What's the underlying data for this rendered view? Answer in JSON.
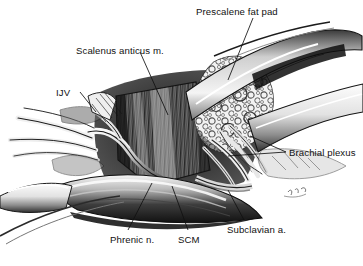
{
  "figure": {
    "kind": "surgical-anatomical-illustration",
    "background_color": "#ffffff",
    "ink_color": "#111111",
    "style": "pen-and-ink stipple / hatched medical drawing, grayscale"
  },
  "labels": [
    {
      "id": "prescalene-fat-pad",
      "text": "Prescalene fat pad",
      "x": 196,
      "y": 7,
      "anchor": "start"
    },
    {
      "id": "scalenus-anticus",
      "text": "Scalenus anticus m.",
      "x": 76,
      "y": 46,
      "anchor": "start"
    },
    {
      "id": "ijv",
      "text": "IJV",
      "x": 56,
      "y": 88,
      "anchor": "start"
    },
    {
      "id": "brachial-plexus",
      "text": "Brachial plexus",
      "x": 289,
      "y": 148,
      "anchor": "start"
    },
    {
      "id": "subclavian-artery",
      "text": "Subclavian a.",
      "x": 227,
      "y": 225,
      "anchor": "start"
    },
    {
      "id": "phrenic-nerve",
      "text": "Phrenic n.",
      "x": 110,
      "y": 235,
      "anchor": "start"
    },
    {
      "id": "scm",
      "text": "SCM",
      "x": 178,
      "y": 235,
      "anchor": "start"
    }
  ],
  "leader_lines": [
    {
      "id": "leader-prescalene-fat-pad",
      "from": [
        253,
        18
      ],
      "to": [
        228,
        80
      ]
    },
    {
      "id": "leader-scalenus-anticus",
      "from": [
        140,
        52
      ],
      "to": [
        168,
        115
      ]
    },
    {
      "id": "leader-ijv",
      "from": [
        80,
        92
      ],
      "to": [
        96,
        112
      ]
    },
    {
      "id": "leader-brachial-plexus-a",
      "from": [
        286,
        152
      ],
      "to": [
        228,
        156
      ]
    },
    {
      "id": "leader-brachial-plexus-b",
      "from": [
        286,
        152
      ],
      "to": [
        250,
        136
      ]
    },
    {
      "id": "leader-subclavian-artery",
      "from": [
        244,
        220
      ],
      "to": [
        228,
        190
      ]
    },
    {
      "id": "leader-phrenic-nerve",
      "from": [
        128,
        230
      ],
      "to": [
        152,
        183
      ]
    },
    {
      "id": "leader-scm",
      "from": [
        188,
        230
      ],
      "to": [
        172,
        186
      ]
    }
  ],
  "structures": [
    {
      "id": "prescalene-fat-pad-mass",
      "name": "Prescalene fat pad",
      "note": "lobulated cloud-like pale mass, upper right of field"
    },
    {
      "id": "scalenus-anticus-muscle",
      "name": "Scalenus anticus muscle",
      "note": "vertically striated dark muscle belly, center"
    },
    {
      "id": "phrenic-nerve-cord",
      "name": "Phrenic nerve",
      "note": "pale cord crossing obliquely over scalene muscle"
    },
    {
      "id": "internal-jugular-vein",
      "name": "Internal jugular vein",
      "note": "retracted vessel, left of field"
    },
    {
      "id": "brachial-plexus-trunks",
      "name": "Brachial plexus",
      "note": "fascicles emerging lateral to scalene, right"
    },
    {
      "id": "subclavian-artery-vessel",
      "name": "Subclavian artery",
      "note": "deep vessel at base of scalene triangle"
    },
    {
      "id": "sternocleidomastoid-muscle",
      "name": "Sternocleidomastoid muscle",
      "note": "broad retracted band across lower field"
    },
    {
      "id": "retractor-blades",
      "name": "Retractor blades",
      "note": "upper right and lower margins holding wound open"
    },
    {
      "id": "artist-signature",
      "name": "Artist signature",
      "note": "faint cursive mark, lower right"
    }
  ]
}
